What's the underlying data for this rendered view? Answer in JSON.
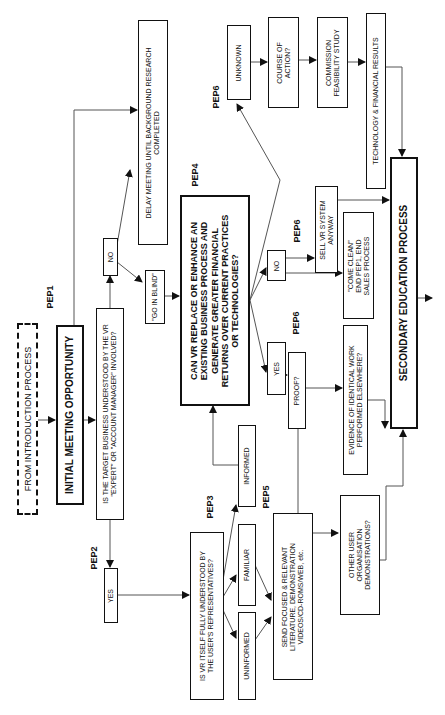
{
  "diagram": {
    "orientation": "rotated 90deg counter-clockwise",
    "nodes": {
      "from_intro": "FROM INTRODUCTION PROCESS",
      "initial_meeting": "INITIAL MEETING OPPORTUNITY",
      "target_business_q": [
        "IS THE TARGET BUSINESS UNDERSTOOD BY THE VR",
        "\"EXPERT\" OR \"ACCOUNT MANAGER\" INVOLVED?"
      ],
      "yes_pep2": "YES",
      "no_pep2": "NO",
      "delay_meeting": [
        "DELAY MEETING UNTIL BACKGROUND RESEARCH",
        "COMPLETED"
      ],
      "go_in_blind": "\"GO IN BLIND\"",
      "can_vr_replace": [
        "CAN VR REPLACE OR ENHANCE AN",
        "EXISTING BUSINESS PROCESS AND",
        "GENERATE GREATER FINANCIAL",
        "RETURNS OVER CURRENT PRACTICES",
        "OR TECHNOLOGIES?"
      ],
      "vr_understood_q": [
        "IS VR ITSELF FULLY UNDERSTOOD BY",
        "THE USER'S REPRESENTATIVES?"
      ],
      "uninformed": "UNINFORMED",
      "familiar": "FAMILIAR",
      "informed": "INFORMED",
      "send_focused": [
        "SEND FOCUSED & RELEVANT",
        "LITERATURE, DEMONSTRATION",
        "VIDEOS/CD-ROMS/WEB, etc."
      ],
      "yes_pep6": "YES",
      "no_pep6": "NO",
      "proof_q": "PROOF?",
      "evidence": [
        "EVIDENCE OF IDENTICAL WORK",
        "PERFORMED ELSEWHERE?"
      ],
      "other_user_demos": [
        "OTHER USER",
        "ORGANISATION",
        "DEMONSTRATIONS?"
      ],
      "sell_anyway": [
        "SELL VR SYSTEM",
        "ANYWAY"
      ],
      "come_clean": [
        "\"COME CLEAN\"",
        "END PEP1, END",
        "SALES PROCESS"
      ],
      "unknown": "UNKNOWN",
      "course_of_action": [
        "COURSE OF",
        "ACTION?"
      ],
      "commission_study": [
        "COMMISSION",
        "FEASIBILITY STUDY"
      ],
      "tech_fin_results": "TECHNOLOGY & FINANCIAL RESULTS",
      "secondary_education": "SECONDARY EDUCATION PROCESS"
    },
    "labels": {
      "pep1": "PEP1",
      "pep2": "PEP2",
      "pep3": "PEP3",
      "pep4": "PEP4",
      "pep5": "PEP5",
      "pep6_a": "PEP6",
      "pep6_b": "PEP6",
      "pep6_c": "PEP6"
    }
  }
}
